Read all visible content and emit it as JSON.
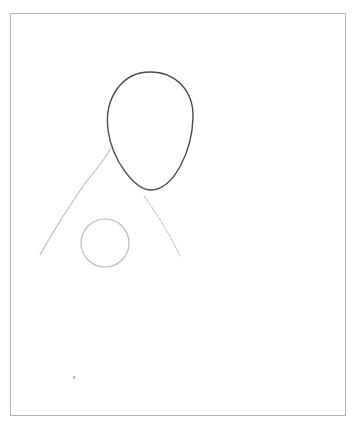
{
  "image": {
    "description": "Pencil sketch of a figure: oval head, shoulder lines and a small circle, inside a thin rectangular frame",
    "colors": {
      "background": "#ffffff",
      "frame": "#b4b4b4",
      "head_stroke": "#4a4a4a",
      "light_stroke": "#bdbdbd"
    }
  },
  "shapes": {
    "frame": {
      "x": 10,
      "y": 13,
      "width": 335,
      "height": 402
    },
    "head": {
      "cx": 150,
      "cy": 126,
      "rx": 42,
      "ry": 58
    },
    "circle": {
      "cx": 105,
      "cy": 243,
      "r": 24
    },
    "left_shoulder": {
      "x1": 111,
      "y1": 148,
      "x2": 40,
      "y2": 255
    },
    "right_shoulder": {
      "x1": 144,
      "y1": 196,
      "x2": 180,
      "y2": 256
    },
    "dot": {
      "x": 74,
      "y": 378
    }
  }
}
